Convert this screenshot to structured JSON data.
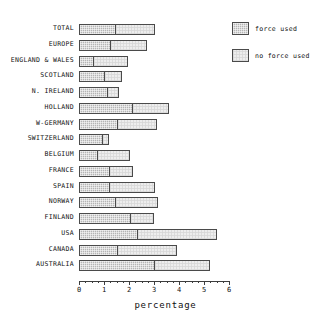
{
  "chart_data": {
    "type": "bar",
    "orientation": "horizontal",
    "stacked": true,
    "title": "",
    "xlabel": "percentage",
    "ylabel": "",
    "xlim": [
      0,
      6
    ],
    "xticks": [
      0,
      1,
      2,
      3,
      4,
      5,
      6
    ],
    "xtick_labels": [
      "0",
      "1",
      "2",
      "3",
      "4",
      "5",
      "6"
    ],
    "grid": false,
    "legend_position": "top-right",
    "categories": [
      "TOTAL",
      "EUROPE",
      "ENGLAND & WALES",
      "SCOTLAND",
      "N. IRELAND",
      "HOLLAND",
      "W-GERMANY",
      "SWITZERLAND",
      "BELGIUM",
      "FRANCE",
      "SPAIN",
      "NORWAY",
      "FINLAND",
      "USA",
      "CANADA",
      "AUSTRALIA"
    ],
    "series": [
      {
        "name": "force used",
        "color": "#b5b5b5",
        "values": [
          1.45,
          1.25,
          0.55,
          1.0,
          1.1,
          2.1,
          1.5,
          0.9,
          0.7,
          1.2,
          1.2,
          1.45,
          2.05,
          2.3,
          1.5,
          3.0
        ]
      },
      {
        "name": "no force used",
        "color": "#ededed",
        "values": [
          1.6,
          1.45,
          1.4,
          0.7,
          0.5,
          1.5,
          1.6,
          0.3,
          1.35,
          0.95,
          1.85,
          1.7,
          0.95,
          3.2,
          2.4,
          2.25
        ]
      }
    ],
    "totals": [
      3.05,
      2.7,
      1.95,
      1.7,
      1.6,
      3.6,
      3.1,
      1.2,
      2.05,
      2.15,
      3.05,
      3.15,
      3.0,
      5.5,
      3.9,
      5.25
    ]
  },
  "legend": {
    "items": [
      {
        "label": "force used",
        "swatch": "hatched-dark"
      },
      {
        "label": "no force used",
        "swatch": "plain-light"
      }
    ]
  },
  "axis": {
    "x_title": "percentage",
    "tick_labels": [
      "0",
      "1",
      "2",
      "3",
      "4",
      "5",
      "6"
    ]
  }
}
